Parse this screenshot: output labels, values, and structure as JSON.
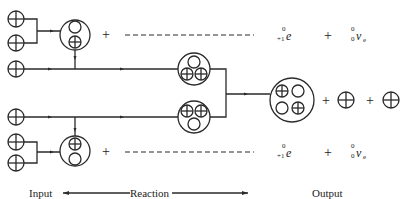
{
  "diagram": {
    "labels": {
      "input": "Input",
      "reaction": "Reaction",
      "output": "Output"
    },
    "operators": {
      "plus": "+"
    },
    "positron": {
      "symbol": "e",
      "mass_number": "0",
      "charge": "+1"
    },
    "neutrino": {
      "symbol": "v",
      "subscript": "e",
      "mass_number": "0",
      "charge": "0"
    },
    "particles": {
      "proton": "proton-icon",
      "neutron": "neutron-icon",
      "deuterium": "deuterium-nucleus-icon",
      "helium3": "helium-3-nucleus-icon",
      "helium4": "helium-4-nucleus-icon"
    },
    "colors": {
      "line": "#2a2a2a",
      "background": "#ffffff"
    }
  }
}
